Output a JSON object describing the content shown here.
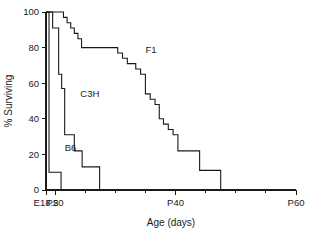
{
  "chart_data": {
    "type": "line",
    "subtype": "kaplan-meier-step",
    "title": "",
    "xlabel": "Age (days)",
    "ylabel": "% Surviving",
    "xlim": [
      18.5,
      60
    ],
    "ylim": [
      0,
      100
    ],
    "grid": false,
    "legend_position": "inline-annotations",
    "x_ticks_major": [
      18.5,
      20,
      40,
      60
    ],
    "x_tick_labels": [
      "E18.5",
      "P20",
      "P40",
      "P60"
    ],
    "x_ticks_minor": [
      25,
      30,
      35,
      45,
      50,
      55
    ],
    "y_ticks": [
      0,
      20,
      40,
      60,
      80,
      100
    ],
    "y_tick_labels": [
      "0",
      "20",
      "40",
      "60",
      "80",
      "100"
    ],
    "series": [
      {
        "name": "B6",
        "label": "B6",
        "label_x": 21.6,
        "label_y": 22,
        "x": [
          18.5,
          19.0,
          19.0,
          21.0,
          21.0
        ],
        "values": [
          100,
          100,
          10,
          10,
          0
        ]
      },
      {
        "name": "C3H",
        "label": "C3H",
        "label_x": 24.2,
        "label_y": 52,
        "x": [
          18.5,
          19.6,
          19.6,
          20.6,
          20.6,
          21.1,
          21.1,
          21.6,
          21.6,
          23.2,
          23.2,
          24.5,
          24.5,
          25.6,
          25.6,
          27.4,
          27.4
        ],
        "values": [
          100,
          100,
          91,
          91,
          65,
          65,
          57,
          57,
          31,
          31,
          22,
          22,
          13,
          13,
          13,
          13,
          0
        ]
      },
      {
        "name": "F1",
        "label": "F1",
        "label_x": 35.0,
        "label_y": 77,
        "x": [
          18.5,
          21.4,
          21.4,
          22.0,
          22.0,
          22.6,
          22.6,
          23.2,
          23.2,
          23.8,
          23.8,
          24.4,
          24.4,
          26.6,
          26.6,
          30.4,
          30.4,
          31.2,
          31.2,
          32.0,
          32.0,
          32.6,
          32.6,
          33.4,
          33.4,
          34.2,
          34.2,
          35.0,
          35.0,
          35.8,
          35.8,
          36.6,
          36.6,
          37.3,
          37.3,
          38.0,
          38.0,
          38.8,
          38.8,
          39.6,
          39.6,
          40.4,
          40.4,
          44.0,
          44.0,
          46.0,
          46.0,
          47.5,
          47.5,
          60.0
        ],
        "values": [
          100,
          100,
          97,
          97,
          94,
          94,
          91,
          91,
          88,
          88,
          85,
          85,
          80,
          80,
          80,
          80,
          77,
          77,
          74,
          74,
          71,
          71,
          71,
          71,
          68,
          68,
          65,
          65,
          54,
          54,
          51,
          51,
          48,
          48,
          40,
          40,
          37,
          37,
          34,
          34,
          31,
          31,
          22,
          22,
          11,
          11,
          11,
          11,
          0,
          0
        ]
      }
    ]
  }
}
